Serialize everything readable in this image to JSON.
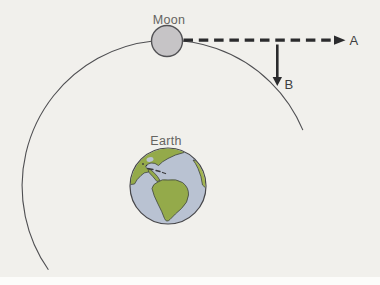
{
  "figure": {
    "labels": {
      "moon": "Moon",
      "earth": "Earth",
      "arrow_a": "A",
      "arrow_b": "B"
    },
    "colors": {
      "background": "#f1f0ec",
      "page_strip": "#fcfcfa",
      "orbit": "#4f4f52",
      "moon_fill": "#c6c4c6",
      "moon_stroke": "#525255",
      "ocean": "#b9c2d2",
      "globe_outline": "#46464a",
      "land": "#94aa4a",
      "land_bright": "#a3b551",
      "land_outline": "#3f4440",
      "island": "#3a3a3c",
      "arrow": "#2b2b2d",
      "label_dark": "#3e3e40",
      "label_muted": "#656461"
    }
  }
}
